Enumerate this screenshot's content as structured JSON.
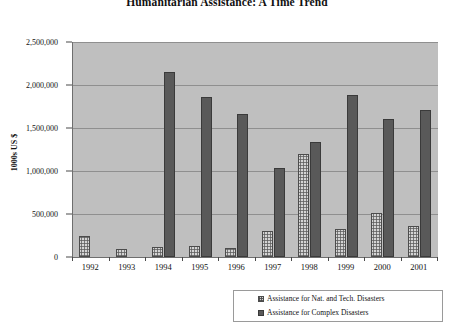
{
  "chart_data": {
    "type": "bar",
    "title": "Humanitarian Assistance: A Time Trend",
    "xlabel": "",
    "ylabel": "1000s US $",
    "categories": [
      "1992",
      "1993",
      "1994",
      "1995",
      "1996",
      "1997",
      "1998",
      "1999",
      "2000",
      "2001"
    ],
    "series": [
      {
        "name": "Assistance for Nat. and Tech. Disasters",
        "color": "#d4d4d4",
        "values": [
          245000,
          93000,
          120000,
          125000,
          110000,
          300000,
          1195000,
          320000,
          510000,
          355000
        ]
      },
      {
        "name": "Assistance for Complex Disasters",
        "color": "#595959",
        "values": [
          0,
          0,
          2150000,
          1855000,
          1660000,
          1030000,
          1340000,
          1880000,
          1600000,
          1715000
        ]
      }
    ],
    "ylim": [
      0,
      2500000
    ],
    "y_ticks": [
      0,
      500000,
      1000000,
      1500000,
      2000000,
      2500000
    ],
    "y_tick_labels": [
      "0",
      "500,000",
      "1,000,000",
      "1,500,000",
      "2,000,000",
      "2,500,000"
    ],
    "grid": true,
    "legend_position": "bottom-right",
    "plot_background": "#bfbfbf"
  },
  "legend": {
    "entries": [
      {
        "label": "Assistance for  Nat. and Tech. Disasters"
      },
      {
        "label": "Assistance for  Complex Disasters"
      }
    ]
  }
}
